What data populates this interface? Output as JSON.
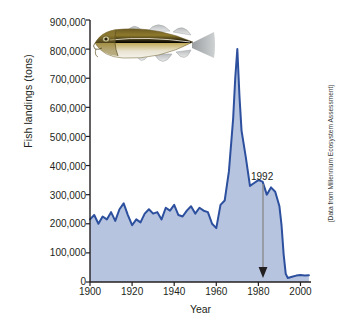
{
  "chart_data": {
    "type": "area",
    "title": "",
    "xlabel": "Year",
    "ylabel": "Fish landings (tons)",
    "xlim": [
      1900,
      2005
    ],
    "ylim": [
      0,
      900000
    ],
    "xticks": [
      1900,
      1920,
      1940,
      1960,
      1980,
      2000
    ],
    "xtick_labels": [
      "1900",
      "1920",
      "1940",
      "1960",
      "1980",
      "2000"
    ],
    "yticks": [
      0,
      100000,
      200000,
      300000,
      400000,
      500000,
      600000,
      700000,
      800000,
      900000
    ],
    "ytick_labels": [
      "0",
      "100,000",
      "200,000",
      "300,000",
      "400,000",
      "500,000",
      "600,000",
      "700,000",
      "800,000",
      "900,000"
    ],
    "grid": false,
    "legend": null,
    "line_color": "#2c4f9e",
    "fill_color": "#b6c4e0",
    "series": [
      {
        "name": "Atlantic cod landings",
        "x": [
          1900,
          1902,
          1904,
          1906,
          1908,
          1910,
          1912,
          1914,
          1916,
          1918,
          1920,
          1922,
          1924,
          1926,
          1928,
          1930,
          1932,
          1934,
          1936,
          1938,
          1940,
          1942,
          1944,
          1946,
          1948,
          1950,
          1952,
          1954,
          1956,
          1958,
          1960,
          1962,
          1964,
          1966,
          1968,
          1969,
          1970,
          1971,
          1972,
          1974,
          1976,
          1978,
          1980,
          1982,
          1984,
          1986,
          1988,
          1990,
          1991,
          1992,
          1993,
          1994,
          1996,
          1998,
          2000,
          2002,
          2004
        ],
        "values": [
          215000,
          230000,
          200000,
          225000,
          215000,
          240000,
          210000,
          250000,
          270000,
          230000,
          195000,
          215000,
          205000,
          235000,
          250000,
          235000,
          240000,
          215000,
          255000,
          245000,
          265000,
          230000,
          225000,
          245000,
          260000,
          235000,
          255000,
          245000,
          240000,
          200000,
          185000,
          265000,
          280000,
          380000,
          560000,
          700000,
          800000,
          640000,
          520000,
          430000,
          330000,
          340000,
          350000,
          345000,
          300000,
          325000,
          310000,
          260000,
          195000,
          95000,
          28000,
          14000,
          18000,
          22000,
          24000,
          22000,
          23000
        ]
      }
    ],
    "annotations": [
      {
        "label": "1992",
        "x": 1992,
        "y": 0,
        "type": "arrow-down"
      }
    ],
    "source_note": "(Data from Millennium Ecosystem Assessment)",
    "illustration": "atlantic-cod-fish"
  }
}
